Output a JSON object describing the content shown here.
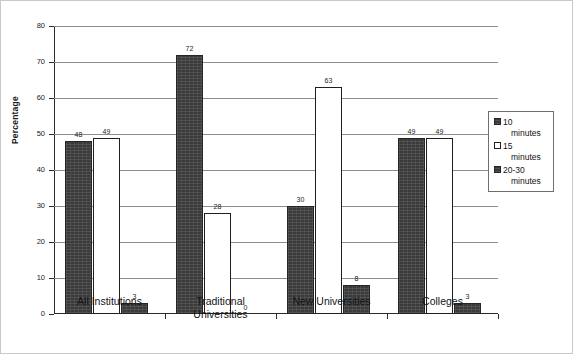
{
  "chart_data": {
    "type": "bar",
    "title": "",
    "xlabel": "",
    "ylabel": "Percentage",
    "ylim": [
      0,
      80
    ],
    "yticks": [
      0,
      10,
      20,
      30,
      40,
      50,
      60,
      70,
      80
    ],
    "grid": true,
    "legend_position": "right",
    "categories": [
      "All Institutions",
      "Traditional Universities",
      "New Universities",
      "Colleges"
    ],
    "category_lines": [
      [
        "All Institutions"
      ],
      [
        "Traditional",
        "Universities"
      ],
      [
        "New Universities"
      ],
      [
        "Colleges"
      ]
    ],
    "series": [
      {
        "name": "10 minutes",
        "color": "#3b3b3b",
        "style": "dark",
        "values": [
          48,
          72,
          30,
          49
        ]
      },
      {
        "name": "15 minutes",
        "color": "#ffffff",
        "style": "light",
        "values": [
          49,
          28,
          63,
          49
        ]
      },
      {
        "name": "20-30 minutes",
        "color": "#3b3b3b",
        "style": "dark",
        "values": [
          3,
          0,
          8,
          3
        ]
      }
    ],
    "data_labels": [
      [
        "48",
        "49",
        "3"
      ],
      [
        "72",
        "28",
        "0"
      ],
      [
        "30",
        "63",
        "8"
      ],
      [
        "49",
        "49",
        "3"
      ]
    ]
  },
  "legend": {
    "items": [
      {
        "line1": "10",
        "line2": "minutes",
        "style": "dark"
      },
      {
        "line1": "15",
        "line2": "minutes",
        "style": "light"
      },
      {
        "line1": "20-30",
        "line2": "minutes",
        "style": "dark"
      }
    ]
  },
  "axis": {
    "y_title": "Percentage",
    "y_tick_labels": [
      "80",
      "70",
      "60",
      "50",
      "40",
      "30",
      "20",
      "10",
      "0"
    ]
  }
}
